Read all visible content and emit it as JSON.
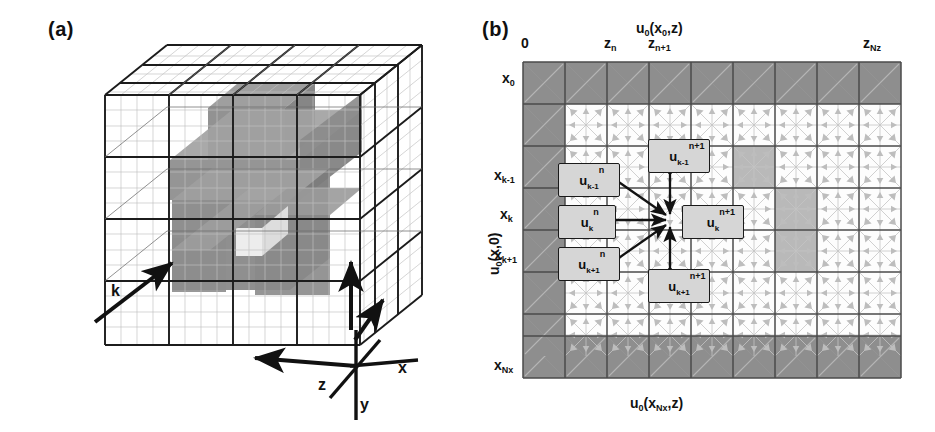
{
  "figure": {
    "panel_a": {
      "label": "(a)",
      "axes": [
        {
          "name": "x",
          "text": "x"
        },
        {
          "name": "y",
          "text": "y"
        },
        {
          "name": "z",
          "text": "z"
        },
        {
          "name": "k",
          "text": "k"
        }
      ],
      "grid": {
        "coarse_divisions": 4,
        "fine_divisions": 16,
        "shaded_block_color": "#8c8c8c",
        "coarse_line_color": "#1a1a1a",
        "fine_line_color": "#b9b9b9"
      }
    },
    "panel_b": {
      "label": "(b)",
      "top_title": "u₀(x₀,z)",
      "bottom_title": "u₀(xₓ,z)",
      "bottom_title_parts": {
        "base": "u",
        "sub0": "0",
        "open": "(x",
        "subNx": "Nx",
        "close": ",z)"
      },
      "top_title_parts": {
        "base": "u",
        "sub0": "0",
        "open": "(x",
        "sub1": "0",
        "close": ",z)"
      },
      "left_title_parts": {
        "base": "u",
        "sub0": "0",
        "rest": "(x,0)"
      },
      "z_ticks": [
        {
          "name": "z-origin",
          "base": "0",
          "sub": ""
        },
        {
          "name": "z-n",
          "base": "z",
          "sub": "n"
        },
        {
          "name": "z-n-plus-1",
          "base": "z",
          "sub": "n+1"
        },
        {
          "name": "z-Nz",
          "base": "z",
          "sub": "Nz"
        }
      ],
      "x_ticks": [
        {
          "name": "x-0",
          "base": "x",
          "sub": "0"
        },
        {
          "name": "x-k-minus-1",
          "base": "x",
          "sub": "k-1"
        },
        {
          "name": "x-k",
          "base": "x",
          "sub": "k"
        },
        {
          "name": "x-k-plus-1",
          "base": "x",
          "sub": "k+1"
        },
        {
          "name": "x-Nx",
          "base": "x",
          "sub": "Nx"
        }
      ],
      "stencil_nodes": [
        {
          "name": "u-k-minus-1-n",
          "base": "u",
          "sub": "k-1",
          "sup": "n",
          "time_level": "n"
        },
        {
          "name": "u-k-n",
          "base": "u",
          "sub": "k",
          "sup": "n",
          "time_level": "n"
        },
        {
          "name": "u-k-plus-1-n",
          "base": "u",
          "sub": "k+1",
          "sup": "n",
          "time_level": "n"
        },
        {
          "name": "u-k-minus-1-n-plus-1",
          "base": "u",
          "sub": "k-1",
          "sup": "n+1",
          "time_level": "n+1"
        },
        {
          "name": "u-k-n-plus-1",
          "base": "u",
          "sub": "k",
          "sup": "n+1",
          "time_level": "n+1"
        },
        {
          "name": "u-k-plus-1-n-plus-1",
          "base": "u",
          "sub": "k+1",
          "sup": "n+1",
          "time_level": "n+1"
        }
      ],
      "colors": {
        "boundary_cell": "#8e8e8e",
        "highlight_cell": "#b9b9b9",
        "interior_cell": "#fdfdfd",
        "major_line": "#4a4a4a",
        "minor_line": "#c9c9c9",
        "stencil_arrow": "#121212",
        "cell_arrow": "#bdbdbd",
        "node_fill": "#d6d6d6",
        "node_stroke": "#1a1a1a"
      },
      "grid_layout": {
        "columns": 9,
        "rows": 7,
        "cell_px": 42,
        "origin_x": 523,
        "origin_y": 62
      },
      "highlight_cells": [
        {
          "col": 4,
          "row": 2
        },
        {
          "col": 5,
          "row": 3
        },
        {
          "col": 5,
          "row": 4
        }
      ]
    }
  }
}
